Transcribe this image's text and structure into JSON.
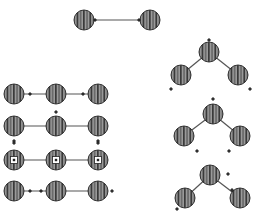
{
  "diagram": {
    "type": "node-link diagrams",
    "colors": {
      "background": "#ffffff",
      "edge": "#555555",
      "node_dark": "#3a3a3a",
      "node_light": "#9a9a9a",
      "node_outline": "#333333",
      "marker": "#222222",
      "core_box": "#ffffff"
    },
    "node_radius": 10,
    "groups": [
      {
        "id": "pair-top",
        "nodes": [
          {
            "x": 84,
            "y": 20
          },
          {
            "x": 150,
            "y": 20
          }
        ],
        "edges": [
          [
            0,
            1
          ]
        ],
        "markers": [
          {
            "x": 95,
            "y": 20
          },
          {
            "x": 139,
            "y": 20
          }
        ]
      },
      {
        "id": "chain-row-1",
        "nodes": [
          {
            "x": 14,
            "y": 94
          },
          {
            "x": 56,
            "y": 94
          },
          {
            "x": 98,
            "y": 94
          }
        ],
        "edges": [
          [
            0,
            1
          ],
          [
            1,
            2
          ]
        ],
        "markers": [
          {
            "x": 30,
            "y": 94
          },
          {
            "x": 83,
            "y": 94
          }
        ]
      },
      {
        "id": "chain-row-2",
        "nodes": [
          {
            "x": 14,
            "y": 126
          },
          {
            "x": 56,
            "y": 126
          },
          {
            "x": 98,
            "y": 126
          }
        ],
        "edges": [
          [
            0,
            1
          ],
          [
            1,
            2
          ]
        ],
        "markers": [
          {
            "x": 14,
            "y": 141
          },
          {
            "x": 56,
            "y": 112
          },
          {
            "x": 98,
            "y": 141
          }
        ]
      },
      {
        "id": "chain-row-3",
        "nodes": [
          {
            "x": 14,
            "y": 160,
            "core": true
          },
          {
            "x": 56,
            "y": 160,
            "core": true
          },
          {
            "x": 98,
            "y": 160,
            "core": true
          }
        ],
        "edges": [
          [
            0,
            1
          ],
          [
            1,
            2
          ]
        ],
        "markers": [
          {
            "x": 14,
            "y": 143
          },
          {
            "x": 98,
            "y": 143
          }
        ]
      },
      {
        "id": "chain-row-4",
        "nodes": [
          {
            "x": 14,
            "y": 191
          },
          {
            "x": 56,
            "y": 191
          },
          {
            "x": 98,
            "y": 191
          }
        ],
        "edges": [
          [
            0,
            1
          ],
          [
            1,
            2
          ]
        ],
        "markers": [
          {
            "x": 30,
            "y": 191
          },
          {
            "x": 41,
            "y": 191
          },
          {
            "x": 112,
            "y": 191
          }
        ]
      },
      {
        "id": "tree-1",
        "nodes": [
          {
            "x": 209,
            "y": 52
          },
          {
            "x": 181,
            "y": 75
          },
          {
            "x": 238,
            "y": 75
          }
        ],
        "edges": [
          [
            0,
            1
          ],
          [
            0,
            2
          ]
        ],
        "markers": [
          {
            "x": 209,
            "y": 40
          },
          {
            "x": 171,
            "y": 89
          },
          {
            "x": 250,
            "y": 89
          }
        ]
      },
      {
        "id": "tree-2",
        "nodes": [
          {
            "x": 213,
            "y": 114
          },
          {
            "x": 184,
            "y": 136
          },
          {
            "x": 240,
            "y": 136
          }
        ],
        "edges": [
          [
            0,
            1
          ],
          [
            0,
            2
          ]
        ],
        "markers": [
          {
            "x": 213,
            "y": 99
          },
          {
            "x": 197,
            "y": 151
          },
          {
            "x": 229,
            "y": 151
          }
        ]
      },
      {
        "id": "tree-3",
        "nodes": [
          {
            "x": 210,
            "y": 175
          },
          {
            "x": 185,
            "y": 198
          },
          {
            "x": 240,
            "y": 198
          }
        ],
        "edges": [
          [
            0,
            1
          ],
          [
            0,
            2
          ]
        ],
        "markers": [
          {
            "x": 228,
            "y": 174
          },
          {
            "x": 232,
            "y": 190
          },
          {
            "x": 177,
            "y": 209
          }
        ]
      }
    ]
  }
}
